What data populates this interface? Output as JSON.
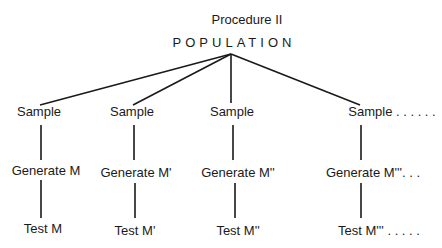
{
  "title": "Procedure II",
  "root": "POPULATION",
  "branches": [
    {
      "sample": "Sample",
      "generate": "Generate M",
      "test": "Test M"
    },
    {
      "sample": "Sample",
      "generate": "Generate M'",
      "test": "Test M'"
    },
    {
      "sample": "Sample",
      "generate": "Generate M''",
      "test": "Test M''"
    },
    {
      "sample": "Sample . . . . . .",
      "generate": "Generate M'''. . .",
      "test": "Test M''' . . . . ."
    }
  ]
}
